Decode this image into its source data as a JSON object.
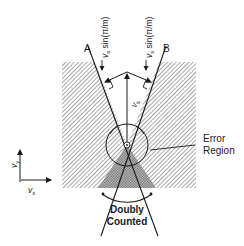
{
  "figure": {
    "line_a_label": "A",
    "line_b_label": "B",
    "left_component_label_main": "v",
    "left_component_label_sub": "s",
    "left_component_label_rest": " sin(π/m)",
    "right_component_label_main": "v",
    "right_component_label_sub": "s",
    "right_component_label_rest": " sin(π/m)",
    "vs_label_main": "v",
    "vs_label_sub": "s",
    "error_region_line1": "Error",
    "error_region_line2": "Region",
    "doubly_counted_line1": "Doubly",
    "doubly_counted_line2": "Counted",
    "axis_y_main": "v",
    "axis_y_sub": "y",
    "axis_x_main": "v",
    "axis_x_sub": "x"
  },
  "colors": {
    "ink": "#1a1a1a",
    "hatch": "#8a8a8a",
    "background": "#ffffff"
  }
}
